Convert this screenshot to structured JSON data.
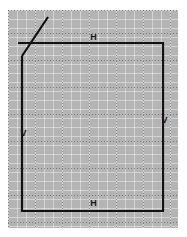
{
  "canvas": {
    "width": 187,
    "height": 237,
    "background_color": "#ffffff",
    "grid_color": "#b4b4b4",
    "gridline_color": "#4a4a4a",
    "geometry_color": "#111111"
  },
  "grid": {
    "panel": {
      "x": 8,
      "y": 10,
      "width": 170,
      "height": 218
    },
    "major_spacing": 27,
    "minor_spacing": 9,
    "major_vertical_x": [
      8,
      35,
      62,
      89,
      116,
      143,
      170
    ],
    "major_horizontal_y": [
      6,
      33,
      60,
      87,
      114,
      141,
      168,
      195
    ]
  },
  "geometry": {
    "profile": {
      "name": "rectangle-profile",
      "left_x": 22,
      "right_x": 163,
      "top_y": 43,
      "bottom_y": 211,
      "stroke_width": 2.2
    },
    "edges": [
      {
        "name": "top-edge",
        "x1": 18,
        "y1": 43,
        "x2": 163,
        "y2": 43
      },
      {
        "name": "right-edge",
        "x1": 163,
        "y1": 43,
        "x2": 163,
        "y2": 211
      },
      {
        "name": "bottom-edge",
        "x1": 163,
        "y1": 211,
        "x2": 22,
        "y2": 211
      },
      {
        "name": "left-edge",
        "x1": 22,
        "y1": 211,
        "x2": 22,
        "y2": 56
      },
      {
        "name": "diagonal-edge",
        "x1": 22,
        "y1": 56,
        "x2": 48,
        "y2": 17
      }
    ]
  },
  "constraints": [
    {
      "id": "c1",
      "symbol": "H",
      "type": "horizontal",
      "edge": "top-edge",
      "x": 93,
      "y": 38
    },
    {
      "id": "c2",
      "symbol": "H",
      "type": "horizontal",
      "edge": "bottom-edge",
      "x": 93,
      "y": 204
    },
    {
      "id": "c3",
      "symbol": "V",
      "type": "vertical",
      "edge": "left-edge",
      "x": 23,
      "y": 134
    },
    {
      "id": "c4",
      "symbol": "V",
      "type": "vertical",
      "edge": "right-edge",
      "x": 164,
      "y": 121
    }
  ]
}
